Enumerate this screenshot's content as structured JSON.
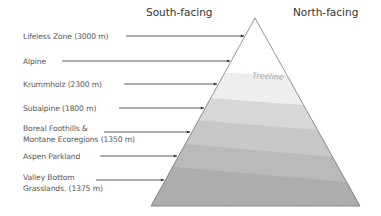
{
  "headers": {
    "south": "South-facing",
    "north": "North-facing"
  },
  "treeline_label": "Treeline",
  "zones": [
    {
      "line1": "Lifeless Zone (3000 m)",
      "line2": ""
    },
    {
      "line1": "Alpine",
      "line2": ""
    },
    {
      "line1": "Krummholz (2300 m)",
      "line2": ""
    },
    {
      "line1": "Subalpine (1800 m)",
      "line2": ""
    },
    {
      "line1": "Boreal Foothills &",
      "line2": "Montane Ecoregions (1350 m)"
    },
    {
      "line1": "Aspen Parkland",
      "line2": ""
    },
    {
      "line1": "Valley Bottom",
      "line2": "Grasslands. (1375 m)"
    }
  ],
  "colors": {
    "band_top": "#ffffff",
    "band_treeline": "#eeeeee",
    "band_2": "#d3d3d3",
    "band_3": "#c3c3c3",
    "band_4": "#b5b5b5",
    "band_5": "#aaaaaa",
    "band_6": "#a0a0a0",
    "outline": "#777777",
    "arrow": "#333333"
  }
}
